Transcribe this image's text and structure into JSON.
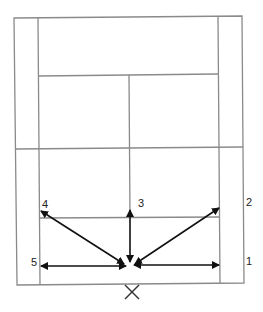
{
  "diagram": {
    "type": "badminton-court-footwork",
    "colors": {
      "court_line": "#8a8a8a",
      "arrow": "#111111",
      "label": "#222222"
    },
    "court": {
      "outer": {
        "x1": 15,
        "y1": 17,
        "x2": 243,
        "y2": 284
      },
      "side_inner_left_x": 39,
      "side_inner_right_x": 219,
      "back_service_line_y": 75,
      "net_line_y": 149,
      "center_line_x": 129,
      "front_service_line_y": 218
    },
    "base_position": {
      "x": 130,
      "y": 265,
      "marker": "X",
      "marker_x": 132,
      "marker_y": 292
    },
    "moves": [
      {
        "id": "1",
        "label": "1",
        "to": {
          "x": 219,
          "y": 265
        },
        "label_pos": {
          "x": 246,
          "y": 256
        }
      },
      {
        "id": "2",
        "label": "2",
        "to": {
          "x": 219,
          "y": 208
        },
        "label_pos": {
          "x": 246,
          "y": 197
        }
      },
      {
        "id": "3",
        "label": "3",
        "to": {
          "x": 130,
          "y": 210
        },
        "label_pos": {
          "x": 138,
          "y": 198
        }
      },
      {
        "id": "4",
        "label": "4",
        "to": {
          "x": 41,
          "y": 211
        },
        "label_pos": {
          "x": 42,
          "y": 199
        }
      },
      {
        "id": "5",
        "label": "5",
        "to": {
          "x": 41,
          "y": 266
        },
        "label_pos": {
          "x": 31,
          "y": 257
        }
      }
    ]
  }
}
